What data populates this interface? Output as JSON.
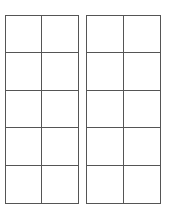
{
  "diagram": {
    "type": "double-ten-frame",
    "frames": [
      {
        "name": "left-ten-frame",
        "columns": 2,
        "rows": 5,
        "filled_cells": 0
      },
      {
        "name": "right-ten-frame",
        "columns": 2,
        "rows": 5,
        "filled_cells": 0
      }
    ],
    "line_color": "#555555",
    "background": "#ffffff"
  }
}
